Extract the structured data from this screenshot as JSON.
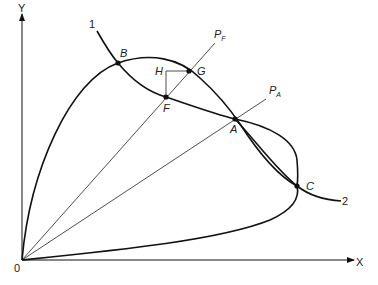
{
  "axes": {
    "origin_label": "0",
    "x_label": "X",
    "y_label": "Y"
  },
  "curves": {
    "curve1_label": "1",
    "curve2_label": "2"
  },
  "rays": {
    "pf_main": "P",
    "pf_sub": "F",
    "pa_main": "P",
    "pa_sub": "A"
  },
  "points": {
    "A": "A",
    "B": "B",
    "C": "C",
    "F": "F",
    "G": "G",
    "H": "H"
  }
}
